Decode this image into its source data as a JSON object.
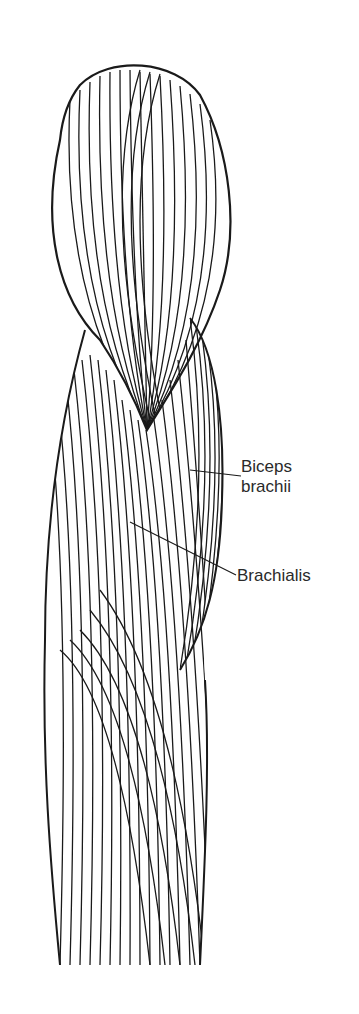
{
  "figure": {
    "stroke_color": "#1a1a1a",
    "background": "#ffffff"
  },
  "labels": [
    {
      "id": "biceps",
      "lines": [
        "Biceps",
        "brachii"
      ],
      "leader_from": [
        241,
        476
      ],
      "leader_to": [
        190,
        470
      ]
    },
    {
      "id": "brachialis",
      "lines": [
        "Brachialis"
      ],
      "leader_from": [
        236,
        575
      ],
      "leader_to": [
        130,
        522
      ]
    }
  ]
}
